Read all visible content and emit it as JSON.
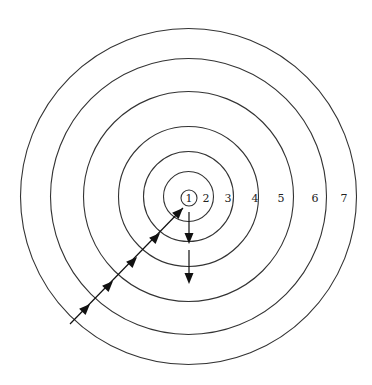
{
  "diagram": {
    "type": "concentric-circles",
    "center": [
      188.5,
      196.5
    ],
    "rings": [
      {
        "label": "1",
        "radius": 8,
        "label_x": 189
      },
      {
        "label": "2",
        "radius": 25,
        "label_x": 206
      },
      {
        "label": "3",
        "radius": 45,
        "label_x": 228
      },
      {
        "label": "4",
        "radius": 70,
        "label_x": 255
      },
      {
        "label": "5",
        "radius": 105,
        "label_x": 281
      },
      {
        "label": "6",
        "radius": 138,
        "label_x": 315
      },
      {
        "label": "7",
        "radius": 168,
        "label_x": 344
      }
    ],
    "label_y": 198,
    "diagonal_path": {
      "start": [
        70,
        324
      ],
      "end": [
        183,
        208
      ]
    },
    "diagonal_arrowheads": [
      [
        90,
        304
      ],
      [
        113,
        281
      ],
      [
        137,
        257
      ],
      [
        160,
        233
      ],
      [
        183,
        208
      ]
    ],
    "vertical_arrows": [
      {
        "from": [
          189,
          212
        ],
        "to": [
          189,
          244
        ]
      },
      {
        "from": [
          189,
          250
        ],
        "to": [
          189,
          284
        ]
      }
    ],
    "colors": {
      "stroke": "#333333",
      "arrow": "#111111",
      "background": "#ffffff"
    }
  }
}
